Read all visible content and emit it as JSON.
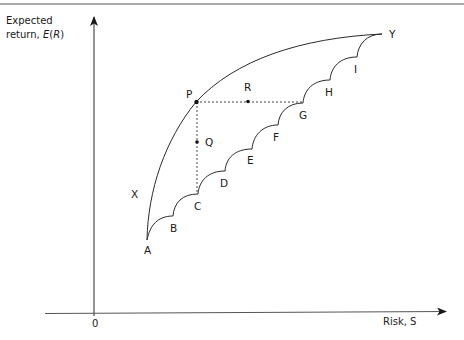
{
  "diagram": {
    "type": "efficient-frontier",
    "y_axis": {
      "label_line1": "Expected",
      "label_line2_prefix": "return, ",
      "label_line2_italic_E": "E",
      "label_line2_paren_open": "(",
      "label_line2_italic_R": "R",
      "label_line2_paren_close": ")"
    },
    "x_axis": {
      "label": "Risk, S",
      "origin": "0"
    },
    "curve_labels": {
      "X": "X",
      "Y": "Y",
      "A": "A",
      "B": "B",
      "C": "C",
      "D": "D",
      "E": "E",
      "F": "F",
      "G": "G",
      "H": "H",
      "I": "I"
    },
    "points": {
      "P": "P",
      "Q": "Q",
      "R": "R"
    },
    "colors": {
      "line": "#2a2a2a",
      "top_rule": "#a8a8a8",
      "background": "#ffffff"
    }
  }
}
